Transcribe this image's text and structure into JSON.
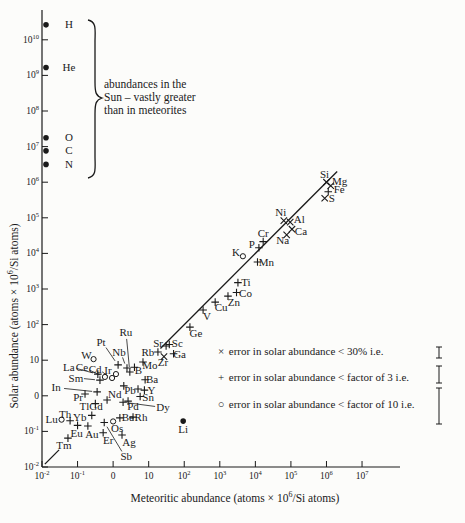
{
  "figure": {
    "bg": "#fcfcfa",
    "ink": "#1a1a1a"
  },
  "y_axis": {
    "label_pre": "Solar abundance (atoms × 10",
    "label_sup": "6",
    "label_post": "/Si atoms)",
    "ticks": [
      {
        "text": "10",
        "sup": "10",
        "v": 10
      },
      {
        "text": "10",
        "sup": "9",
        "v": 9
      },
      {
        "text": "10",
        "sup": "8",
        "v": 8
      },
      {
        "text": "10",
        "sup": "7",
        "v": 7
      },
      {
        "text": "10",
        "sup": "6",
        "v": 6
      },
      {
        "text": "10",
        "sup": "5",
        "v": 5
      },
      {
        "text": "10",
        "sup": "4",
        "v": 4
      },
      {
        "text": "10",
        "sup": "3",
        "v": 3
      },
      {
        "text": "10",
        "sup": "2",
        "v": 2
      },
      {
        "text": "10",
        "sup": "",
        "v": 1
      },
      {
        "text": "0",
        "sup": "",
        "v": 0
      },
      {
        "text": "10",
        "sup": "-1",
        "v": -1
      },
      {
        "text": "10",
        "sup": "-2",
        "v": -2
      }
    ]
  },
  "x_axis": {
    "label_pre": "Meteoritic abundance (atoms × 10",
    "label_sup": "6",
    "label_post": "/Si atoms)",
    "ticks": [
      {
        "text": "10",
        "sup": "-2",
        "v": -2
      },
      {
        "text": "10",
        "sup": "-1",
        "v": -1
      },
      {
        "text": "0",
        "sup": "",
        "v": 0
      },
      {
        "text": "10",
        "sup": "",
        "v": 1
      },
      {
        "text": "10",
        "sup": "2",
        "v": 2
      },
      {
        "text": "10",
        "sup": "3",
        "v": 3
      },
      {
        "text": "10",
        "sup": "4",
        "v": 4
      },
      {
        "text": "10",
        "sup": "5",
        "v": 5
      },
      {
        "text": "10",
        "sup": "6",
        "v": 6
      },
      {
        "text": "10",
        "sup": "7",
        "v": 7
      }
    ]
  },
  "annotation": {
    "lines": [
      "abundances in the",
      "Sun – vastly greater",
      "than in meteorites"
    ]
  },
  "legend": [
    {
      "symbol": "×",
      "text": "error in solar abundance < 30% i.e.",
      "row_y": 0,
      "bar_top": 347,
      "bar_bot": 358
    },
    {
      "symbol": "+",
      "text": "error in solar abundance < factor of 3 i.e.",
      "row_y": 26,
      "bar_top": 366,
      "bar_bot": 383
    },
    {
      "symbol": "○",
      "text": "error in solar abundance < factor of 10 i.e.",
      "row_y": 53,
      "bar_top": 388,
      "bar_bot": 424
    }
  ],
  "chart_data": {
    "type": "scatter",
    "title": "",
    "xlabel": "Meteoritic abundance (atoms × 10^6/Si atoms)",
    "ylabel": "Solar abundance (atoms × 10^6/Si atoms)",
    "x_log_range": [
      -2,
      7
    ],
    "y_log_range": [
      -2,
      10.6
    ],
    "grid": false,
    "identity_line": true,
    "line_segments": [
      {
        "x1": -1.92,
        "y1": -1.92,
        "x2": -1.52,
        "y2": -1.52
      },
      {
        "x1": 1.33,
        "y1": 1.33,
        "x2": 6.3,
        "y2": 6.3
      }
    ],
    "solar_only_note": "abundances in the Sun - vastly greater than in meteorites",
    "solar_only": [
      {
        "el": "H",
        "log_sol": 10.42
      },
      {
        "el": "He",
        "log_sol": 9.22
      },
      {
        "el": "O",
        "log_sol": 7.25
      },
      {
        "el": "C",
        "log_sol": 6.88
      },
      {
        "el": "N",
        "log_sol": 6.5
      }
    ],
    "points": [
      {
        "el": "Si",
        "sym": "cross",
        "log_met": 6.0,
        "log_sol": 6.0,
        "dx": -2,
        "dy": -8
      },
      {
        "el": "Mg",
        "sym": "cross",
        "log_met": 6.12,
        "log_sol": 5.9,
        "dx": 9,
        "dy": -4
      },
      {
        "el": "Fe",
        "sym": "plus",
        "log_met": 6.05,
        "log_sol": 5.73,
        "dx": 11,
        "dy": -2
      },
      {
        "el": "S",
        "sym": "cross",
        "log_met": 5.95,
        "log_sol": 5.55,
        "dx": 7,
        "dy": 0
      },
      {
        "el": "Ni",
        "sym": "cross",
        "log_met": 4.8,
        "log_sol": 4.92,
        "dx": -3,
        "dy": -8
      },
      {
        "el": "Al",
        "sym": "cross",
        "log_met": 4.98,
        "log_sol": 4.88,
        "dx": 9,
        "dy": -3
      },
      {
        "el": "Ca",
        "sym": "cross",
        "log_met": 5.03,
        "log_sol": 4.68,
        "dx": 9,
        "dy": 2
      },
      {
        "el": "Na",
        "sym": "cross",
        "log_met": 4.88,
        "log_sol": 4.52,
        "dx": -4,
        "dy": 6
      },
      {
        "el": "Cr",
        "sym": "plus",
        "log_met": 4.22,
        "log_sol": 4.33,
        "dx": 0,
        "dy": -8
      },
      {
        "el": "P",
        "sym": "plus",
        "log_met": 4.1,
        "log_sol": 4.16,
        "dx": -7,
        "dy": -3
      },
      {
        "el": "K",
        "sym": "circle",
        "log_met": 3.65,
        "log_sol": 3.92,
        "dx": -7,
        "dy": -4
      },
      {
        "el": "Mn",
        "sym": "plus",
        "log_met": 4.06,
        "log_sol": 3.76,
        "dx": 9,
        "dy": 1
      },
      {
        "el": "Ti",
        "sym": "plus",
        "log_met": 3.51,
        "log_sol": 3.18,
        "dx": 8,
        "dy": 0
      },
      {
        "el": "Co",
        "sym": "plus",
        "log_met": 3.47,
        "log_sol": 2.9,
        "dx": 9,
        "dy": 1
      },
      {
        "el": "Zn",
        "sym": "plus",
        "log_met": 3.23,
        "log_sol": 2.8,
        "dx": 6,
        "dy": 6
      },
      {
        "el": "Cu",
        "sym": "plus",
        "log_met": 2.87,
        "log_sol": 2.63,
        "dx": 6,
        "dy": 5
      },
      {
        "el": "V",
        "sym": "plus",
        "log_met": 2.53,
        "log_sol": 2.41,
        "dx": 4,
        "dy": 6
      },
      {
        "el": "Ge",
        "sym": "plus",
        "log_met": 2.16,
        "log_sol": 1.93,
        "dx": 6,
        "dy": 6
      },
      {
        "el": "Sr",
        "sym": "plus",
        "log_met": 1.49,
        "log_sol": 1.4,
        "dx": -8,
        "dy": -2
      },
      {
        "el": "Sc",
        "sym": "plus",
        "log_met": 1.58,
        "log_sol": 1.44,
        "dx": 8,
        "dy": -1
      },
      {
        "el": "Rb",
        "sym": "plus",
        "log_met": 1.26,
        "log_sol": 1.23,
        "dx": -10,
        "dy": 0
      },
      {
        "el": "Ga",
        "sym": "plus",
        "log_met": 1.7,
        "log_sol": 1.18,
        "dx": 6,
        "dy": 1
      },
      {
        "el": "Zr",
        "sym": "cross",
        "log_met": 1.43,
        "log_sol": 1.1,
        "dx": -1,
        "dy": 6
      },
      {
        "el": "Mo",
        "sym": "plus",
        "log_met": 0.84,
        "log_sol": 0.95,
        "dx": 7,
        "dy": 4
      },
      {
        "el": "B",
        "sym": "plus",
        "log_met": 0.6,
        "log_sol": 0.8,
        "dx": 4,
        "dy": 3
      },
      {
        "el": "Ba",
        "sym": "plus",
        "log_met": 0.9,
        "log_sol": 0.45,
        "dx": 7,
        "dy": 0
      },
      {
        "el": "Pb",
        "sym": "plus",
        "log_met": 0.7,
        "log_sol": 0.19,
        "dx": -8,
        "dy": 1
      },
      {
        "el": "Y",
        "sym": "plus",
        "log_met": 0.88,
        "log_sol": 0.16,
        "dx": 7,
        "dy": 0
      },
      {
        "el": "Sn",
        "sym": "plus",
        "log_met": 0.76,
        "log_sol": -0.02,
        "dx": 8,
        "dy": 1
      },
      {
        "el": "Nd",
        "sym": "plus",
        "log_met": 0.3,
        "log_sol": 0.28,
        "dx": -9,
        "dy": 9
      },
      {
        "el": "Pd",
        "sym": "plus",
        "log_met": 0.42,
        "log_sol": -0.15,
        "dx": 5,
        "dy": 5
      },
      {
        "el": "Dy",
        "sym": "plus",
        "log_met": 0.28,
        "log_sol": -0.18,
        "dx": 40,
        "dy": 5,
        "leader": true
      },
      {
        "el": "Rh",
        "sym": "plus",
        "log_met": 0.56,
        "log_sol": -0.6,
        "dx": 8,
        "dy": 0
      },
      {
        "el": "Be",
        "sym": "plus",
        "log_met": 0.19,
        "log_sol": -0.62,
        "dx": 8,
        "dy": 0
      },
      {
        "el": "Os",
        "sym": "circle",
        "log_met": 0.0,
        "log_sol": -0.72,
        "dx": 4,
        "dy": 7
      },
      {
        "el": "Ag",
        "sym": "plus",
        "log_met": 0.25,
        "log_sol": -1.1,
        "dx": 7,
        "dy": 8
      },
      {
        "el": "Er",
        "sym": "plus",
        "log_met": -0.28,
        "log_sol": -1.04,
        "dx": 5,
        "dy": 8
      },
      {
        "el": "Au",
        "sym": "plus",
        "log_met": -0.71,
        "log_sol": -0.85,
        "dx": 4,
        "dy": 8
      },
      {
        "el": "Eu",
        "sym": "plus",
        "log_met": -1.0,
        "log_sol": -0.83,
        "dx": -1,
        "dy": 8
      },
      {
        "el": "Tm",
        "sym": "plus",
        "log_met": -1.27,
        "log_sol": -1.19,
        "dx": -4,
        "dy": 7
      },
      {
        "el": "Th",
        "sym": "plus",
        "log_met": -1.21,
        "log_sol": -0.7,
        "dx": -5,
        "dy": -6
      },
      {
        "el": "Lu",
        "sym": "circle",
        "log_met": -1.45,
        "log_sol": -0.67,
        "dx": -10,
        "dy": 0
      },
      {
        "el": "Yb",
        "sym": "plus",
        "log_met": -0.6,
        "log_sol": -0.55,
        "dx": -12,
        "dy": 2
      },
      {
        "el": "Tl",
        "sym": "plus",
        "log_met": -0.5,
        "log_sol": -0.22,
        "dx": -11,
        "dy": 3
      },
      {
        "el": "Gd",
        "sym": "plus",
        "log_met": -0.17,
        "log_sol": -0.12,
        "dx": -11,
        "dy": 6
      },
      {
        "el": "Pr",
        "sym": "plus",
        "log_met": -0.79,
        "log_sol": 0.05,
        "dx": -7,
        "dy": 3
      },
      {
        "el": "In",
        "sym": "plus",
        "log_met": -0.45,
        "log_sol": 0.11,
        "dx": -41,
        "dy": -4,
        "leader": true
      },
      {
        "el": "Sm",
        "sym": "plus",
        "log_met": -0.37,
        "log_sol": 0.44,
        "dx": -24,
        "dy": -2,
        "leader": true
      },
      {
        "el": "La",
        "sym": "plus",
        "log_met": -0.43,
        "log_sol": 0.61,
        "dx": -29,
        "dy": -7,
        "leader": true
      },
      {
        "el": "Ce",
        "sym": "circle",
        "log_met": -0.23,
        "log_sol": 0.53,
        "dx": -23,
        "dy": -9,
        "leader": true
      },
      {
        "el": "Cd",
        "sym": "circle",
        "log_met": -0.03,
        "log_sol": 0.5,
        "dx": -17,
        "dy": -9,
        "leader": true
      },
      {
        "el": "Ir",
        "sym": "circle",
        "log_met": 0.08,
        "log_sol": 0.61,
        "dx": -8,
        "dy": -4
      },
      {
        "el": "W",
        "sym": "circle",
        "log_met": -0.55,
        "log_sol": 1.03,
        "dx": -7,
        "dy": -4
      },
      {
        "el": "Pt",
        "sym": "plus",
        "log_met": 0.14,
        "log_sol": 0.87,
        "dx": -17,
        "dy": -22,
        "leader": true
      },
      {
        "el": "Nb",
        "sym": "plus",
        "log_met": 0.39,
        "log_sol": 0.78,
        "dx": -8,
        "dy": -16,
        "leader": true
      },
      {
        "el": "Ru",
        "sym": "plus",
        "log_met": 0.47,
        "log_sol": 0.67,
        "dx": -4,
        "dy": -39,
        "leader": true
      },
      {
        "el": "Li",
        "sym": "dot",
        "log_met": 1.97,
        "log_sol": -0.71,
        "dx": 0,
        "dy": 8
      },
      {
        "el": "Sb",
        "sym": "plus",
        "log_met": -0.25,
        "log_sol": -0.75,
        "dx": 22,
        "dy": 34,
        "leader": true
      }
    ]
  }
}
